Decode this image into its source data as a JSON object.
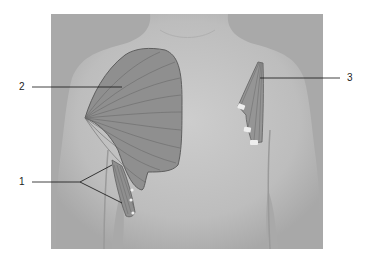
{
  "figure": {
    "background_color": "#a9a9a9",
    "skin_color": "#c4c4c4",
    "muscle_fill": "#8f8f8f",
    "muscle_stroke": "#5e5e5e",
    "tendon_color": "#eeeeee"
  },
  "labels": [
    {
      "id": "1",
      "text": "1"
    },
    {
      "id": "2",
      "text": "2"
    },
    {
      "id": "3",
      "text": "3"
    }
  ]
}
